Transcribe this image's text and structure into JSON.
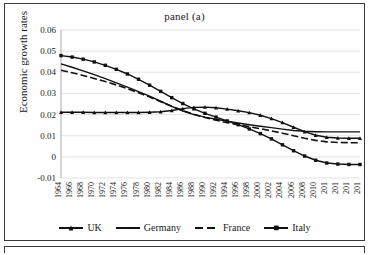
{
  "figure": {
    "title": "panel (a)",
    "ylabel": "Economic growth rates"
  },
  "legend": {
    "items": [
      {
        "label": "UK",
        "marker": "triangle",
        "dash": "solid"
      },
      {
        "label": "Germany",
        "marker": "none",
        "dash": "solid"
      },
      {
        "label": "France",
        "marker": "none",
        "dash": "dashed"
      },
      {
        "label": "Italy",
        "marker": "square",
        "dash": "solid"
      }
    ]
  },
  "chart_data": {
    "type": "line",
    "title": "panel (a)",
    "xlabel": "",
    "ylabel": "Economic growth rates",
    "ylim": [
      -0.01,
      0.06
    ],
    "yticks": [
      "0.06",
      "0.05",
      "0.04",
      "0.03",
      "0.02",
      "0.01",
      "0",
      "-0.01"
    ],
    "ytick_values": [
      0.06,
      0.05,
      0.04,
      0.03,
      0.02,
      0.01,
      0,
      -0.01
    ],
    "grid": true,
    "legend_position": "bottom",
    "x": [
      1964,
      1966,
      1968,
      1970,
      1972,
      1974,
      1976,
      1978,
      1980,
      1982,
      1984,
      1986,
      1988,
      1990,
      1992,
      1994,
      1996,
      1998,
      2000,
      2002,
      2004,
      2006,
      2008,
      2010,
      2012,
      2014,
      2016,
      2018
    ],
    "xtick_labels": [
      "1964",
      "1966",
      "1968",
      "1970",
      "1972",
      "1974",
      "1976",
      "1978",
      "1980",
      "1982",
      "1984",
      "1986",
      "1988",
      "1990",
      "1992",
      "1994",
      "1996",
      "1998",
      "2000",
      "2002",
      "2004",
      "2006",
      "2008",
      "2010",
      "201",
      "201",
      "201",
      "201"
    ],
    "series": [
      {
        "name": "UK",
        "marker": "triangle",
        "dash": "solid",
        "values": [
          0.0211,
          0.0211,
          0.0211,
          0.021,
          0.021,
          0.021,
          0.021,
          0.021,
          0.0211,
          0.0213,
          0.0219,
          0.0228,
          0.0234,
          0.0235,
          0.0232,
          0.0226,
          0.0218,
          0.0209,
          0.0197,
          0.0181,
          0.0162,
          0.014,
          0.0119,
          0.0102,
          0.0093,
          0.0089,
          0.0088,
          0.0088
        ]
      },
      {
        "name": "Germany",
        "marker": "none",
        "dash": "solid",
        "values": [
          0.044,
          0.0424,
          0.0407,
          0.0389,
          0.037,
          0.035,
          0.033,
          0.0309,
          0.0287,
          0.0263,
          0.0239,
          0.0217,
          0.02,
          0.0188,
          0.0178,
          0.0169,
          0.016,
          0.0152,
          0.0145,
          0.0138,
          0.0131,
          0.0125,
          0.0121,
          0.0119,
          0.0118,
          0.0118,
          0.0118,
          0.0118
        ]
      },
      {
        "name": "France",
        "marker": "none",
        "dash": "dashed",
        "values": [
          0.041,
          0.0398,
          0.0385,
          0.0371,
          0.0356,
          0.034,
          0.0322,
          0.0303,
          0.0283,
          0.0261,
          0.0239,
          0.0219,
          0.0201,
          0.0186,
          0.0173,
          0.0162,
          0.0152,
          0.0143,
          0.0133,
          0.0123,
          0.0112,
          0.01,
          0.0088,
          0.0078,
          0.0071,
          0.0068,
          0.0067,
          0.0067
        ]
      },
      {
        "name": "Italy",
        "marker": "square",
        "dash": "solid",
        "values": [
          0.0479,
          0.0472,
          0.0462,
          0.0449,
          0.0433,
          0.0414,
          0.0392,
          0.0367,
          0.0339,
          0.031,
          0.028,
          0.0252,
          0.0227,
          0.0206,
          0.0188,
          0.017,
          0.0152,
          0.0132,
          0.011,
          0.0085,
          0.0057,
          0.0029,
          0.0004,
          -0.0016,
          -0.0029,
          -0.0034,
          -0.0036,
          -0.0036
        ]
      }
    ]
  }
}
